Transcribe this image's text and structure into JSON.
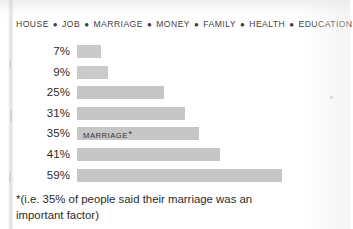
{
  "chart_data": {
    "type": "bar",
    "orientation": "horizontal",
    "title": "",
    "xlabel": "",
    "ylabel": "",
    "grid": false,
    "legend": "none",
    "xlim": [
      0,
      59
    ],
    "categories": [
      "7%",
      "9%",
      "25%",
      "31%",
      "35%",
      "41%",
      "59%"
    ],
    "values": [
      7,
      9,
      25,
      31,
      35,
      41,
      59
    ],
    "value_labels": [
      "7%",
      "9%",
      "25%",
      "31%",
      "35%",
      "41%",
      "59%"
    ],
    "bar_labels": [
      "",
      "",
      "",
      "",
      "MARRIAGE",
      "",
      ""
    ],
    "bar_color": "#c6c6c6",
    "annotations": [
      "*(i.e. 35% of people said their marriage was an important factor)"
    ]
  },
  "header": {
    "categories": [
      "HOUSE",
      "JOB",
      "MARRIAGE",
      "MONEY",
      "FAMILY",
      "HEALTH",
      "EDUCATION"
    ],
    "separator": "●"
  },
  "rows": [
    {
      "pct": "7%",
      "value": 7,
      "label": ""
    },
    {
      "pct": "9%",
      "value": 9,
      "label": ""
    },
    {
      "pct": "25%",
      "value": 25,
      "label": ""
    },
    {
      "pct": "31%",
      "value": 31,
      "label": ""
    },
    {
      "pct": "35%",
      "value": 35,
      "label": "MARRIAGE"
    },
    {
      "pct": "41%",
      "value": 41,
      "label": ""
    },
    {
      "pct": "59%",
      "value": 59,
      "label": ""
    }
  ],
  "footnote": {
    "line1": "*(i.e. 35% of people said their marriage was an",
    "line2": "important factor)",
    "full": "*(i.e. 35% of people said their marriage was an important factor)"
  },
  "style": {
    "bar_color": "#c6c6c6",
    "text_color": "#2b2b2b",
    "background": "#ffffff"
  }
}
